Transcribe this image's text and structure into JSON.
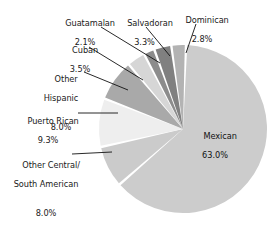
{
  "chart_data": {
    "type": "pie",
    "title": "",
    "subtitle": "",
    "xlabel": "",
    "ylabel": "",
    "legend_position": "none",
    "grid": false,
    "value_unit": "%",
    "total": 100.0,
    "categories": [
      "Mexican",
      "Puerto Rican",
      "Other Central/\nSouth American",
      "Other Hispanic",
      "Cuban",
      "Salvadoran",
      "Dominican",
      "Guatamalan"
    ],
    "values": [
      63.0,
      9.3,
      8.0,
      8.0,
      3.5,
      3.3,
      2.8,
      2.1
    ],
    "slices": [
      {
        "name": "Mexican",
        "label": "Mexican",
        "value": 63.0,
        "value_label": "63.0%",
        "color": "#cccccc",
        "label_placement": "inside"
      },
      {
        "name": "Other Central/South American",
        "label_line1": "Other Central/",
        "label_line2": "South American",
        "value": 8.0,
        "value_label": "8.0%",
        "color": "#cbcbcb",
        "label_placement": "outside-left"
      },
      {
        "name": "Puerto Rican",
        "label": "Puerto Rican",
        "value": 9.3,
        "value_label": "9.3%",
        "color": "#eeeeee",
        "label_placement": "outside-left"
      },
      {
        "name": "Other Hispanic",
        "label_line1": "Other",
        "label_line2": "Hispanic",
        "value": 8.0,
        "value_label": "8.0%",
        "color": "#a9a9a9",
        "label_placement": "outside-left"
      },
      {
        "name": "Cuban",
        "label": "Cuban",
        "value": 3.5,
        "value_label": "3.5%",
        "color": "#d6d6d6",
        "label_placement": "outside-upper-left"
      },
      {
        "name": "Guatamalan",
        "label": "Guatamalan",
        "value": 2.1,
        "value_label": "2.1%",
        "color": "#8c8c8c",
        "label_placement": "outside-top"
      },
      {
        "name": "Salvadoran",
        "label": "Salvadoran",
        "value": 3.3,
        "value_label": "3.3%",
        "color": "#808080",
        "label_placement": "outside-top"
      },
      {
        "name": "Dominican",
        "label": "Dominican",
        "value": 2.8,
        "value_label": "2.8%",
        "color": "#b3b3b3",
        "label_placement": "outside-top-right"
      }
    ]
  },
  "labels": {
    "guatamalan": {
      "name": "Guatamalan",
      "pct": "2.1%"
    },
    "salvadoran": {
      "name": "Salvadoran",
      "pct": "3.3%"
    },
    "dominican": {
      "name": "Dominican",
      "pct": "2.8%"
    },
    "cuban": {
      "name": "Cuban",
      "pct": "3.5%"
    },
    "other_hispanic": {
      "line1": "Other",
      "line2": "Hispanic",
      "pct": "8.0%"
    },
    "puerto_rican": {
      "name": "Puerto Rican",
      "pct": "9.3%"
    },
    "other_central": {
      "line1": "Other Central/",
      "line2": "South American",
      "pct": "8.0%"
    },
    "mexican": {
      "name": "Mexican",
      "pct": "63.0%"
    }
  },
  "colors": {
    "background": "#ffffff",
    "text": "#1a1a1a",
    "leader_line": "#111111",
    "slice_gap": "#ffffff"
  }
}
